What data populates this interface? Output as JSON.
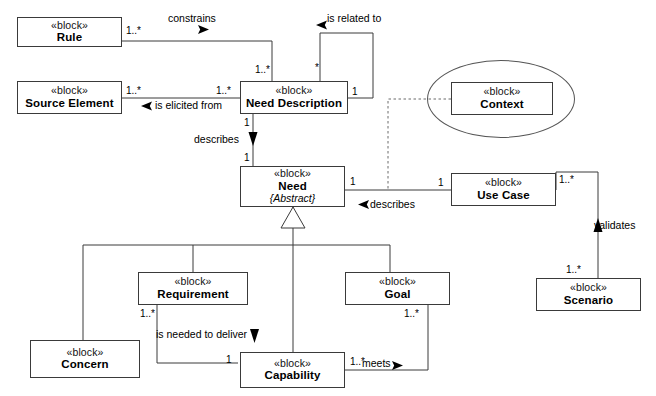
{
  "diagram": {
    "stereotype_label": "«block»",
    "line_color": "#3a3a3a",
    "background": "#ffffff"
  },
  "blocks": [
    {
      "id": "rule",
      "stereotype": "«block»",
      "name": "Rule",
      "modifier": ""
    },
    {
      "id": "source_element",
      "stereotype": "«block»",
      "name": "Source Element",
      "modifier": ""
    },
    {
      "id": "need_description",
      "stereotype": "«block»",
      "name": "Need Description",
      "modifier": ""
    },
    {
      "id": "context",
      "stereotype": "«block»",
      "name": "Context",
      "modifier": ""
    },
    {
      "id": "need",
      "stereotype": "«block»",
      "name": "Need",
      "modifier": "{Abstract}"
    },
    {
      "id": "use_case",
      "stereotype": "«block»",
      "name": "Use Case",
      "modifier": ""
    },
    {
      "id": "scenario",
      "stereotype": "«block»",
      "name": "Scenario",
      "modifier": ""
    },
    {
      "id": "requirement",
      "stereotype": "«block»",
      "name": "Requirement",
      "modifier": ""
    },
    {
      "id": "goal",
      "stereotype": "«block»",
      "name": "Goal",
      "modifier": ""
    },
    {
      "id": "concern",
      "stereotype": "«block»",
      "name": "Concern",
      "modifier": ""
    },
    {
      "id": "capability",
      "stereotype": "«block»",
      "name": "Capability",
      "modifier": ""
    }
  ],
  "relationships": [
    {
      "id": "constrains",
      "label": "constrains",
      "from": "rule",
      "to": "need_description",
      "source_mult": "1..*",
      "target_mult": "1..*"
    },
    {
      "id": "is_related_to",
      "label": "is related to",
      "from": "need_description",
      "to": "need_description",
      "source_mult": "*",
      "target_mult": "1"
    },
    {
      "id": "is_elicited_from",
      "label": "is elicited from",
      "from": "source_element",
      "to": "need_description",
      "source_mult": "1..*",
      "target_mult": "1..*"
    },
    {
      "id": "describes_need",
      "label": "describes",
      "from": "need_description",
      "to": "need",
      "source_mult": "1",
      "target_mult": "1"
    },
    {
      "id": "describes_uc",
      "label": "describes",
      "from": "use_case",
      "to": "need",
      "source_mult": "1",
      "target_mult": "1"
    },
    {
      "id": "validates",
      "label": "validates",
      "from": "scenario",
      "to": "use_case",
      "source_mult": "1..*",
      "target_mult": "1..*"
    },
    {
      "id": "needed_deliver",
      "label": "is needed to deliver",
      "from": "capability",
      "to": "requirement",
      "source_mult": "1",
      "target_mult": "1..*"
    },
    {
      "id": "meets",
      "label": "meets",
      "from": "capability",
      "to": "goal",
      "source_mult": "1..*",
      "target_mult": "1..*"
    },
    {
      "id": "context_dep",
      "label": "",
      "from": "context",
      "to": "describes_uc",
      "source_mult": "",
      "target_mult": ""
    }
  ],
  "generalization": {
    "parent": "need",
    "children": [
      "concern",
      "requirement",
      "capability",
      "goal"
    ]
  },
  "multiplicity_labels": {
    "rule_right": "1..*",
    "nd_top_left": "1..*",
    "nd_top_right": "*",
    "nd_left": "1..*",
    "nd_right": "1",
    "nd_bottom": "1",
    "source_element_right": "1..*",
    "need_top": "1",
    "need_right": "1",
    "use_case_left": "1",
    "use_case_right": "1..*",
    "scenario_top": "1..*",
    "requirement_bottom": "1..*",
    "capability_left": "1",
    "capability_right": "1..*",
    "goal_bottom": "1..*"
  },
  "relation_labels": {
    "constrains": "constrains",
    "is_related_to": "is related to",
    "is_elicited_from": "is elicited from",
    "describes_top": "describes",
    "describes_right": "describes",
    "validates": "validates",
    "is_needed_to_deliver": "is needed to deliver",
    "meets": "meets"
  }
}
